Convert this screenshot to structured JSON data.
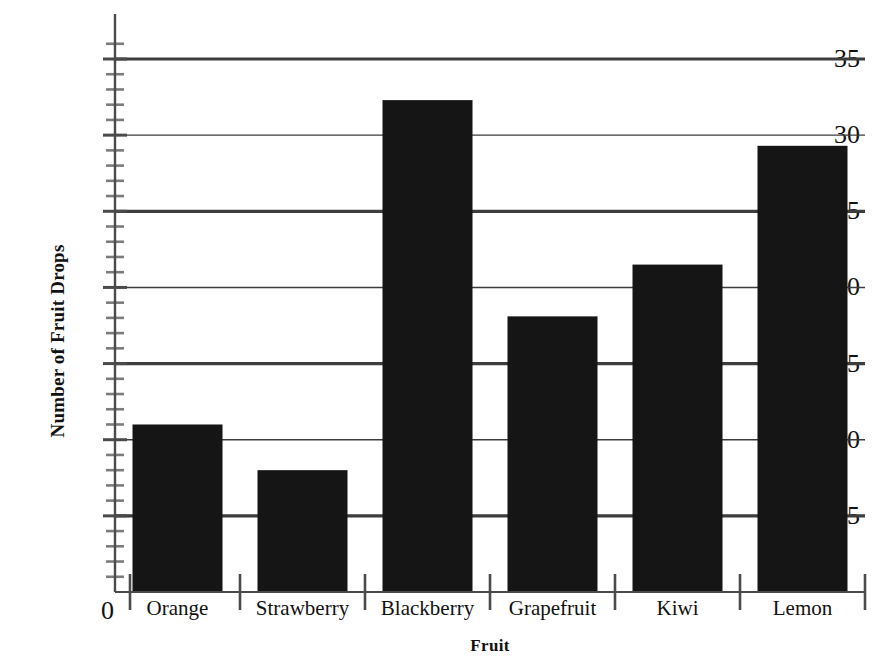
{
  "chart_data": {
    "type": "bar",
    "title": "",
    "xlabel": "Fruit",
    "ylabel": "Number of Fruit Drops",
    "categories": [
      "Orange",
      "Strawberry",
      "Blackberry",
      "Grapefruit",
      "Kiwi",
      "Lemon"
    ],
    "values": [
      11.0,
      8.0,
      32.3,
      18.1,
      21.5,
      29.3
    ],
    "ylim": [
      0,
      36
    ],
    "xlim": [
      0,
      6
    ],
    "y_major_ticks": [
      5,
      10,
      15,
      20,
      25,
      30,
      35
    ],
    "y_tick_labels": [
      "5",
      "10",
      "15",
      "20",
      "25",
      "30",
      "35"
    ],
    "y_minor_tick_interval": 1,
    "y_origin_label": "0",
    "grid": "horizontal",
    "grid_emphasis_values": [
      5,
      15,
      25,
      35
    ],
    "legend": "none",
    "bar_color": "#151515",
    "axis_color": "#4a4a4a",
    "grid_color": "#3d3d3d",
    "background_color": "#ffffff",
    "bar_width_fraction": 0.72
  }
}
